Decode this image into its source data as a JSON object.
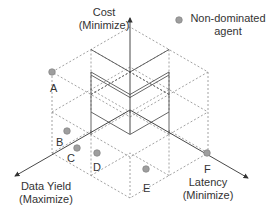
{
  "axes": {
    "cost": {
      "line1": "Cost",
      "line2": "(Minimize)"
    },
    "data_yield": {
      "line1": "Data Yield",
      "line2": "(Maximize)"
    },
    "latency": {
      "line1": "Latency",
      "line2": "(Minimize)"
    }
  },
  "legend": {
    "marker_label_line1": "Non-dominated",
    "marker_label_line2": "agent",
    "marker_color": "#9e9e9e"
  },
  "points": [
    {
      "id": "A",
      "x": 52,
      "y": 72
    },
    {
      "id": "B",
      "x": 67,
      "y": 131
    },
    {
      "id": "C",
      "x": 77,
      "y": 148
    },
    {
      "id": "D",
      "x": 97,
      "y": 153
    },
    {
      "id": "E",
      "x": 146,
      "y": 169
    },
    {
      "id": "F",
      "x": 207,
      "y": 153
    }
  ],
  "colors": {
    "solid": "#555555",
    "dashed": "#8a8a8a",
    "point_fill": "#9e9e9e",
    "point_stroke": "#7a7a7a"
  }
}
